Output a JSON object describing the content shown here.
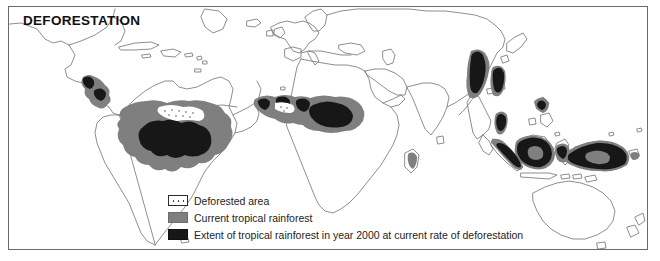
{
  "figure": {
    "title": "DEFORESTATION",
    "background_color": "#ffffff",
    "frame_color": "#6b6b6b"
  },
  "legend": {
    "items": [
      {
        "swatch": "dotted-white-swatch",
        "label": "Deforested area",
        "color": "#ffffff",
        "pattern": "dotted"
      },
      {
        "swatch": "gray-swatch",
        "label": "Current tropical rainforest",
        "color": "#7f7f7f",
        "pattern": "solid"
      },
      {
        "swatch": "black-swatch",
        "label": "Extent of tropical rainforest in year 2000 at current rate of deforestation",
        "color": "#171717",
        "pattern": "solid"
      }
    ]
  },
  "map": {
    "type": "world-thematic-map",
    "projection": "equirectangular-world",
    "coastline_color": "#7a7a7a",
    "regions": [
      {
        "name": "Central America and Caribbean",
        "current_rainforest": true,
        "year_2000_extent": true
      },
      {
        "name": "Amazon Basin, South America",
        "current_rainforest": true,
        "year_2000_extent": true
      },
      {
        "name": "West Africa and Congo Basin",
        "current_rainforest": true,
        "year_2000_extent": true
      },
      {
        "name": "Madagascar",
        "current_rainforest": true,
        "year_2000_extent": false
      },
      {
        "name": "India and Southeast Asia mainland",
        "current_rainforest": true,
        "year_2000_extent": true
      },
      {
        "name": "Borneo and Indonesia",
        "current_rainforest": true,
        "year_2000_extent": true
      },
      {
        "name": "New Guinea",
        "current_rainforest": true,
        "year_2000_extent": true
      }
    ]
  }
}
